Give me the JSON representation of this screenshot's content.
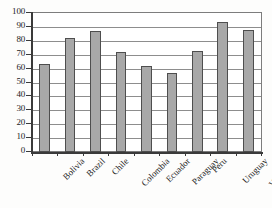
{
  "chart_data": {
    "type": "bar",
    "title": "",
    "subtitle": "",
    "xlabel": "",
    "ylabel": "",
    "categories": [
      "Bolivia",
      "Brazil",
      "Chile",
      "Colombia",
      "Ecuador",
      "Paraguay",
      "Peru",
      "Uruguay",
      "Venezuela"
    ],
    "values": [
      63.5,
      82,
      87,
      72,
      62,
      56.5,
      72.5,
      93.5,
      88
    ],
    "series": [
      {
        "name": "",
        "values": [
          63.5,
          82,
          87,
          72,
          62,
          56.5,
          72.5,
          93.5,
          88
        ]
      }
    ],
    "ylim": [
      0,
      100
    ],
    "ytick_labels": [
      "100",
      "90",
      "80",
      "70",
      "60",
      "50",
      "40",
      "30",
      "20",
      "10",
      "0"
    ],
    "ytick_values": [
      100,
      90,
      80,
      70,
      60,
      50,
      40,
      30,
      20,
      10,
      0
    ],
    "grid": true,
    "grid_axis": "y",
    "legend": false,
    "legend_position": "none",
    "bar_color": "#a8a8a8",
    "bar_edge_color": "#4e4e4e",
    "axis_color": "#3a3a3a",
    "grid_color": "#8d8d8d",
    "background_color": "#ffffff",
    "xtick_label_rotation": -45,
    "annotations": []
  }
}
